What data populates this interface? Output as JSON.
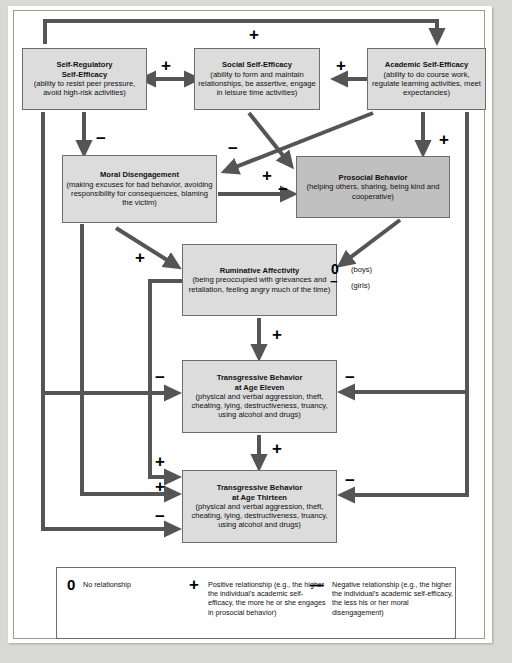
{
  "diagram": {
    "box_fill": "#dcdcdc",
    "box_fill_dark": "#c0c0c0",
    "arrow_color": "#555555",
    "nodes": [
      {
        "id": "self-regulatory-self-efficacy",
        "title": "Self-Regulatory",
        "title2": "Self-Efficacy",
        "detail": "(ability to resist peer pressure, avoid high-risk activities)"
      },
      {
        "id": "social-self-efficacy",
        "title": "Social Self-Efficacy",
        "title2": "",
        "detail": "(ability to form and maintain relationships, be assertive, engage in leisure time activities)"
      },
      {
        "id": "academic-self-efficacy",
        "title": "Academic Self-Efficacy",
        "title2": "",
        "detail": "(ability to do course work, regulate learning activities, meet expectancies)"
      },
      {
        "id": "moral-disengagement",
        "title": "Moral Disengagement",
        "title2": "",
        "detail": "(making excuses for bad behavior, avoiding responsibility for consequences, blaming the victim)"
      },
      {
        "id": "prosocial-behavior",
        "title": "Prosocial Behavior",
        "title2": "",
        "detail": "(helping others, sharing, being kind and cooperative)"
      },
      {
        "id": "ruminative-affectivity",
        "title": "Ruminative Affectivity",
        "title2": "",
        "detail": "(being preoccupied with grievances and retaliation, feeling angry much of the time)"
      },
      {
        "id": "transgressive-behavior-age-eleven",
        "title": "Transgressive Behavior",
        "title2": "at Age Eleven",
        "detail": "(physical and verbal aggression, theft, cheating, lying, destructiveness, truancy, using alcohol and drugs)"
      },
      {
        "id": "transgressive-behavior-age-thirteen",
        "title": "Transgressive Behavior",
        "title2": "at Age Thirteen",
        "detail": "(physical and verbal aggression, theft, cheating, lying, destructiveness, truancy, using alcohol and drugs)"
      }
    ],
    "signs": {
      "top_plus": "+",
      "sr_social_plus": "+",
      "social_acad_plus": "+",
      "sr_moral_minus": "−",
      "acad_moral_minus": "−",
      "social_prosocial_plus": "+",
      "acad_prosocial_plus": "+",
      "moral_prosocial_minus": "−",
      "moral_rumin_plus": "+",
      "rumin_t11_plus": "+",
      "t11_t13_plus": "+",
      "sr_t11_minus": "−",
      "acad_t11_minus": "−",
      "rumin_t13_plus": "+",
      "moral_t13_plus": "+",
      "sr_t13_minus": "−",
      "acad_t13_minus": "−",
      "prosocial_t11_zero": "0",
      "prosocial_t11_minus": "−"
    },
    "annotations": {
      "boys": "(boys)",
      "girls": "(girls)"
    }
  },
  "legend": {
    "items": [
      {
        "symbol": "0",
        "symbol_name": "zero-symbol",
        "text": "No relationship"
      },
      {
        "symbol": "+",
        "symbol_name": "plus-symbol",
        "text": "Positive relationship (e.g., the higher the individual's academic self-efficacy, the more he or she engages in prosocial behavior)"
      },
      {
        "symbol": "—",
        "symbol_name": "minus-symbol",
        "text": "Negative relationship (e.g., the higher the individual's academic self-efficacy, the less his or her moral disengagement)"
      }
    ]
  }
}
